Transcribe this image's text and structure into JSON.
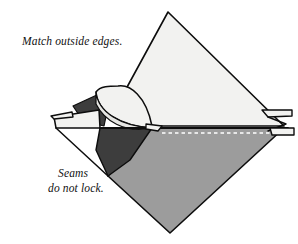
{
  "figure": {
    "kind": "origami-fold-diagram",
    "annotations": [
      {
        "id": "top-note",
        "text": "Match outside edges.",
        "x": 22,
        "y": 45
      },
      {
        "id": "bottom-note-line1",
        "text": "Seams",
        "x": 58,
        "y": 177
      },
      {
        "id": "bottom-note-line2",
        "text": "do not lock.",
        "x": 48,
        "y": 192
      }
    ],
    "colors": {
      "background": "#ffffff",
      "paper_front": "#f2f2f0",
      "paper_front_shadow": "#e6e6e3",
      "paper_back_light": "#9c9c9c",
      "paper_back_mid": "#8f8f8f",
      "paper_dark": "#3d3d3d",
      "paper_darker": "#333333",
      "outline": "#0d0d0d",
      "hidden_edge_dash": "#ffffff",
      "text": "#111111"
    },
    "geometry": {
      "diamond": {
        "top": [
          168,
          12
        ],
        "right": [
          284,
          126
        ],
        "bottom": [
          170,
          233
        ],
        "left": [
          56,
          120
        ]
      },
      "horizontal_fold_y": 128,
      "left_tab_point": [
        51,
        116
      ],
      "right_tab_point": [
        292,
        112
      ],
      "curved_flap_apex": [
        152,
        126
      ]
    },
    "labels": {
      "top_note": "Match outside edges.",
      "bottom_note": "Seams do not lock."
    }
  }
}
